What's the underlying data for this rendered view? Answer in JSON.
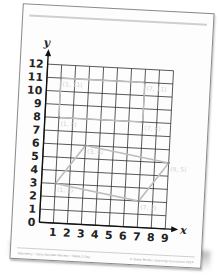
{
  "worksheet": {
    "footer_left": "Geometry • Daily Number Review • Week 2 Day",
    "footer_right": "© Great Minds / Learning Curriculum 2014"
  },
  "chart_data": {
    "type": "scatter",
    "title": "",
    "xlabel": "x",
    "ylabel": "y",
    "xlim": [
      0,
      9
    ],
    "ylim": [
      0,
      12
    ],
    "x_ticks": [
      "0",
      "1",
      "2",
      "3",
      "4",
      "5",
      "6",
      "7",
      "8",
      "9"
    ],
    "y_ticks": [
      "0",
      "1",
      "2",
      "3",
      "4",
      "5",
      "6",
      "7",
      "8",
      "9",
      "10",
      "11",
      "12"
    ],
    "grid": true,
    "points": [
      {
        "label": "(1, 11)",
        "x": 1,
        "y": 11
      },
      {
        "label": "(7, 11)",
        "x": 7,
        "y": 11
      },
      {
        "label": "(1, 8)",
        "x": 1,
        "y": 8
      },
      {
        "label": "(7, 8)",
        "x": 7,
        "y": 8
      },
      {
        "label": "(3, 6)",
        "x": 3,
        "y": 6
      },
      {
        "label": "(9, 5)",
        "x": 9,
        "y": 5
      },
      {
        "label": "(1, 3)",
        "x": 1,
        "y": 3
      },
      {
        "label": "(7, 2)",
        "x": 7,
        "y": 2
      }
    ],
    "shapes": [
      {
        "name": "rectangle",
        "vertices": [
          [
            1,
            11
          ],
          [
            7,
            11
          ],
          [
            7,
            8
          ],
          [
            1,
            8
          ]
        ]
      },
      {
        "name": "parallelogram",
        "vertices": [
          [
            3,
            6
          ],
          [
            9,
            5
          ],
          [
            7,
            2
          ],
          [
            1,
            3
          ]
        ]
      }
    ]
  }
}
